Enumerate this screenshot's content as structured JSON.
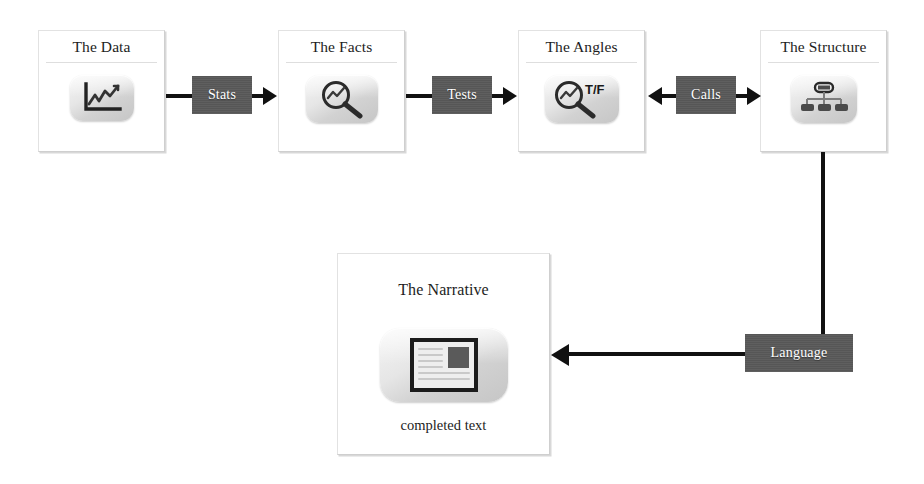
{
  "diagram": {
    "colors": {
      "connector": "#111111",
      "link_box": "#595959",
      "card_border": "#e2e2e2",
      "icon_tile": "#dcdcdc",
      "text": "#1d1d1d"
    },
    "cards": [
      {
        "id": "data",
        "title": "The Data",
        "icon": "line-chart-icon",
        "caption": ""
      },
      {
        "id": "facts",
        "title": "The Facts",
        "icon": "magnifier-chart-icon",
        "caption": ""
      },
      {
        "id": "angles",
        "title": "The Angles",
        "icon": "magnifier-true-false-icon",
        "icon_label": "T/F",
        "caption": ""
      },
      {
        "id": "structure",
        "title": "The Structure",
        "icon": "org-chart-icon",
        "caption": ""
      },
      {
        "id": "narrative",
        "title": "The Narrative",
        "icon": "document-page-icon",
        "caption": "completed text"
      }
    ],
    "connectors": [
      {
        "id": "stats",
        "label": "Stats",
        "direction": "right"
      },
      {
        "id": "tests",
        "label": "Tests",
        "direction": "right"
      },
      {
        "id": "calls",
        "label": "Calls",
        "direction": "both"
      },
      {
        "id": "language",
        "label": "Language",
        "direction": "left"
      }
    ]
  }
}
